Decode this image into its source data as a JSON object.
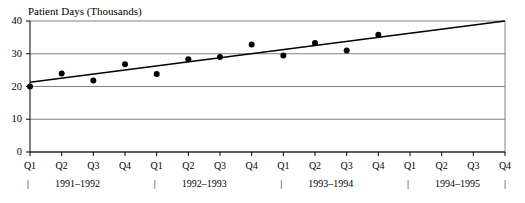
{
  "chart_data": {
    "type": "scatter",
    "title": "Patient Days (Thousands)",
    "xlabel": "",
    "ylabel": "Patient Days (Thousands)",
    "ylim": [
      0,
      40
    ],
    "yticks": [
      0,
      10,
      20,
      30,
      40
    ],
    "ytick_labels": [
      "0",
      "10",
      "20",
      "30",
      "40"
    ],
    "grid": true,
    "grid_axis": "y",
    "legend": "none",
    "categories": [
      "Q1",
      "Q2",
      "Q3",
      "Q4",
      "Q1",
      "Q2",
      "Q3",
      "Q4",
      "Q1",
      "Q2",
      "Q3",
      "Q4",
      "Q1",
      "Q2",
      "Q3",
      "Q4"
    ],
    "group_labels": [
      "1991–1992",
      "1992–1993",
      "1993–1994",
      "1994–1995"
    ],
    "group_separator": "|",
    "values": [
      20.0,
      24.0,
      21.8,
      26.8,
      23.8,
      28.3,
      29.0,
      32.8,
      29.5,
      33.3,
      31.0,
      35.8,
      null,
      null,
      null,
      null
    ],
    "point_color": "#000000",
    "trendline": {
      "name": "linear trend",
      "x_start_index": 0,
      "x_end_index": 15,
      "y_start": 21.3,
      "y_end": 40.0,
      "color": "#000000"
    },
    "colors": {
      "axis": "#000000",
      "grid": "#808080",
      "frame": "#808080",
      "background": "#ffffff"
    }
  }
}
